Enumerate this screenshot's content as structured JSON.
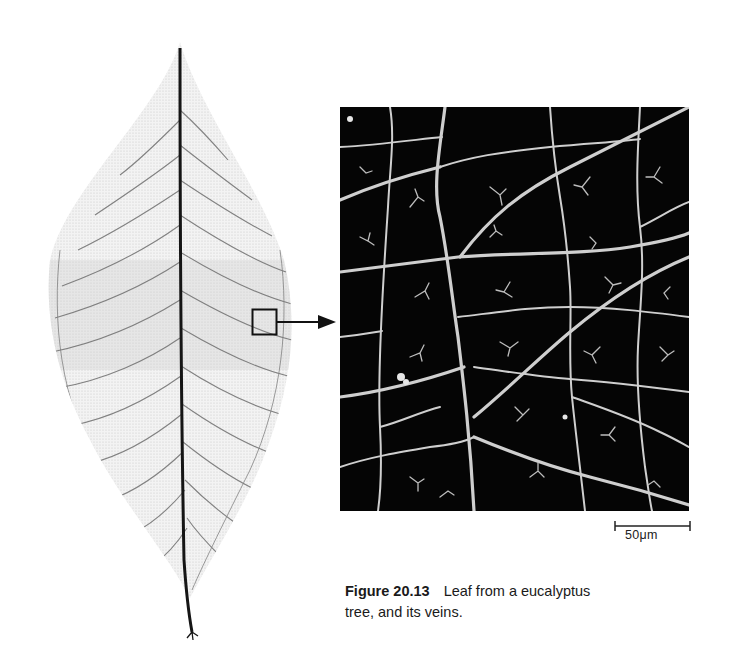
{
  "figure": {
    "number": "Figure 20.13",
    "caption_line1": "Leaf from a eucalyptus",
    "caption_line2": "tree, and its veins.",
    "caption_full": "Leaf from a eucalyptus tree, and its veins."
  },
  "panels": {
    "left": {
      "subject": "whole eucalyptus leaf skeleton",
      "icon": "leaf-icon"
    },
    "right": {
      "subject": "micrograph of leaf vein network (magnified region)"
    }
  },
  "callout": {
    "shape": "square",
    "connector": "arrow-right-icon"
  },
  "scale_bar": {
    "label": "50μm",
    "value": 50,
    "unit": "μm"
  },
  "colors": {
    "background": "#ffffff",
    "micrograph_bg": "#050505",
    "vein_light": "#d8d8d8",
    "leaf_fill": "#eeeeee",
    "midrib": "#1a1a1a",
    "text": "#1a1a1a"
  }
}
